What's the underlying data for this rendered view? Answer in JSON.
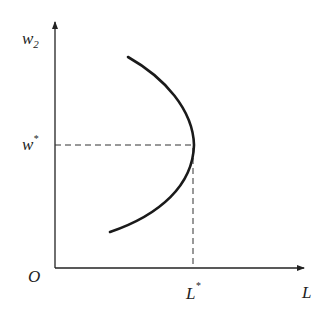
{
  "diagram": {
    "type": "economics-curve",
    "axes": {
      "y_label": "w",
      "y_label_sub": "2",
      "x_label": "L",
      "origin_label": "O"
    },
    "markers": {
      "w_star": "w",
      "w_star_sup": "*",
      "l_star": "L",
      "l_star_sup": "*"
    },
    "colors": {
      "line": "#222222",
      "background": "#ffffff"
    }
  }
}
